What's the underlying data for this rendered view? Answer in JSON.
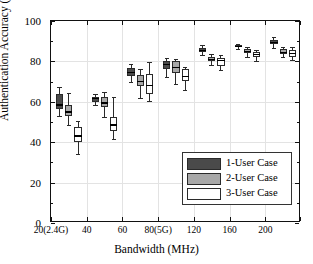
{
  "chart_data": {
    "type": "box",
    "title": "",
    "xlabel": "Bandwidth (MHz)",
    "ylabel": "Authentication Accuracy (%)",
    "ylim": [
      0,
      100
    ],
    "yticks": [
      0,
      20,
      40,
      60,
      80,
      100
    ],
    "ytick_labels": [
      "0",
      "20",
      "40",
      "60",
      "80",
      "100"
    ],
    "categories": [
      "20(2.4G)",
      "40",
      "60",
      "80(5G)",
      "120",
      "160",
      "200"
    ],
    "grid": true,
    "legend_position": "lower-right",
    "legend": [
      "1-User Case",
      "2-User Case",
      "3-User Case"
    ],
    "colors": {
      "1-User Case": "#4a4a4a",
      "2-User Case": "#a8a8a8",
      "3-User Case": "#ffffff",
      "edge": "#2a2a2a",
      "grid": "#e3e3e3",
      "axis": "#111111"
    },
    "series": [
      {
        "name": "1-User Case",
        "color": "#4a4a4a",
        "boxes": [
          {
            "category": "20(2.4G)",
            "whisker_low": 53.0,
            "q1": 56.5,
            "median": 58.5,
            "q3": 64.0,
            "whisker_high": 67.5
          },
          {
            "category": "40",
            "whisker_low": 58.5,
            "q1": 60.0,
            "median": 61.5,
            "q3": 62.5,
            "whisker_high": 64.0
          },
          {
            "category": "60",
            "whisker_low": 70.0,
            "q1": 73.0,
            "median": 74.5,
            "q3": 76.5,
            "whisker_high": 78.5
          },
          {
            "category": "80(5G)",
            "whisker_low": 72.5,
            "q1": 76.0,
            "median": 78.5,
            "q3": 80.0,
            "whisker_high": 81.5
          },
          {
            "category": "120",
            "whisker_low": 83.0,
            "q1": 84.5,
            "median": 85.5,
            "q3": 86.5,
            "whisker_high": 88.0
          },
          {
            "category": "160",
            "whisker_low": 86.0,
            "q1": 87.0,
            "median": 87.5,
            "q3": 88.0,
            "whisker_high": 88.5
          },
          {
            "category": "200",
            "whisker_low": 86.5,
            "q1": 88.5,
            "median": 89.5,
            "q3": 90.5,
            "whisker_high": 92.0
          }
        ]
      },
      {
        "name": "2-User Case",
        "color": "#a8a8a8",
        "boxes": [
          {
            "category": "20(2.4G)",
            "whisker_low": 48.5,
            "q1": 53.0,
            "median": 55.0,
            "q3": 58.5,
            "whisker_high": 64.5
          },
          {
            "category": "40",
            "whisker_low": 52.5,
            "q1": 57.5,
            "median": 59.5,
            "q3": 62.5,
            "whisker_high": 65.0
          },
          {
            "category": "60",
            "whisker_low": 62.0,
            "q1": 68.0,
            "median": 70.0,
            "q3": 73.5,
            "whisker_high": 76.0
          },
          {
            "category": "80(5G)",
            "whisker_low": 69.0,
            "q1": 74.5,
            "median": 77.0,
            "q3": 80.0,
            "whisker_high": 81.0
          },
          {
            "category": "120",
            "whisker_low": 78.0,
            "q1": 80.0,
            "median": 81.0,
            "q3": 82.0,
            "whisker_high": 83.5
          },
          {
            "category": "160",
            "whisker_low": 82.0,
            "q1": 84.0,
            "median": 85.0,
            "q3": 86.0,
            "whisker_high": 87.0
          },
          {
            "category": "200",
            "whisker_low": 82.0,
            "q1": 83.5,
            "median": 84.5,
            "q3": 86.0,
            "whisker_high": 87.0
          }
        ]
      },
      {
        "name": "3-User Case",
        "color": "#ffffff",
        "boxes": [
          {
            "category": "20(2.4G)",
            "whisker_low": 34.0,
            "q1": 40.0,
            "median": 43.0,
            "q3": 47.5,
            "whisker_high": 50.5
          },
          {
            "category": "40",
            "whisker_low": 41.5,
            "q1": 45.5,
            "median": 48.5,
            "q3": 52.5,
            "whisker_high": 62.5
          },
          {
            "category": "60",
            "whisker_low": 60.5,
            "q1": 64.0,
            "median": 68.0,
            "q3": 74.0,
            "whisker_high": 79.5
          },
          {
            "category": "80(5G)",
            "whisker_low": 66.0,
            "q1": 70.5,
            "median": 72.5,
            "q3": 76.0,
            "whisker_high": 77.0
          },
          {
            "category": "120",
            "whisker_low": 75.5,
            "q1": 77.5,
            "median": 80.5,
            "q3": 81.5,
            "whisker_high": 83.0
          },
          {
            "category": "160",
            "whisker_low": 80.0,
            "q1": 82.0,
            "median": 83.5,
            "q3": 84.5,
            "whisker_high": 85.5
          },
          {
            "category": "200",
            "whisker_low": 80.5,
            "q1": 82.0,
            "median": 84.0,
            "q3": 85.5,
            "whisker_high": 87.0
          }
        ]
      }
    ]
  }
}
